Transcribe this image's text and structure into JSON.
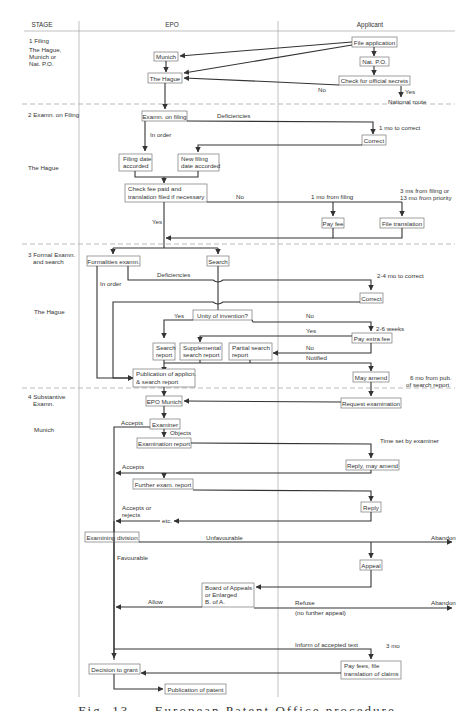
{
  "columns": {
    "stage": "STAGE",
    "epo": "EPO",
    "applicant": "Applicant"
  },
  "stages": [
    {
      "title": "1 Filing",
      "location_lines": [
        "The Hague,",
        "Munich or",
        "Nat. P.O."
      ]
    },
    {
      "title": "2 Examn. on Filing",
      "location_lines": [
        "The Hague"
      ]
    },
    {
      "title_lines": [
        "3 Formal Examn.",
        "and search"
      ],
      "location_lines": [
        "The Hague"
      ]
    },
    {
      "title_lines": [
        "4 Substantive",
        "Examn."
      ],
      "location_lines": [
        "Munich"
      ]
    }
  ],
  "boxes": {
    "file_application": "File application",
    "munich": "Munich",
    "nat_po": "Nat. P.O.",
    "the_hague": "The Hague",
    "check_secrets": "Check for official secrets",
    "examn_on_filing": "Examn. on filing",
    "correct_1": "Correct",
    "filing_date_1": "Filing date",
    "filing_date_2": "accorded",
    "new_filing_1": "New filing",
    "new_filing_2": "date accorded",
    "check_fee_1": "Check fee paid and",
    "check_fee_2": "translation filed if necessary",
    "pay_fee": "Pay fee",
    "file_translation": "File translation",
    "formalities_exam": "Formalities examn.",
    "search": "Search",
    "correct_2": "Correct",
    "unity": "Unity of invention?",
    "pay_extra_fee": "Pay extra fee",
    "search_report_1": "Search",
    "search_report_2": "report",
    "supp_report_1": "Supplemental",
    "supp_report_2": "search report",
    "partial_report_1": "Partial search",
    "partial_report_2": "report",
    "publication_1": "Publication of applicn.",
    "publication_2": "& search report",
    "may_amend": "May amend",
    "epo_munich": "EPO Munich",
    "request_exam": "Request examination",
    "examiner": "Examiner",
    "exam_report": "Examination report",
    "reply_amend": "Reply, may amend",
    "further_exam": "Further exam. report",
    "reply": "Reply",
    "examining_division": "Examining division",
    "appeal": "Appeal",
    "board_1": "Board of Appeals",
    "board_2": "or Enlarged",
    "board_3": "B. of A.",
    "decision": "Decision to grant",
    "pay_fees_1": "Pay fees, file",
    "pay_fees_2": "translation of claims",
    "publication_patent": "Publication of patent"
  },
  "labels": {
    "no_1": "No",
    "yes_1": "Yes",
    "national_route": "National route",
    "deficiencies_1": "Deficiencies",
    "one_mo_correct": "1 mo to correct",
    "in_order_1": "In order",
    "no_2": "No",
    "one_mo_filing": "1 mo from filing",
    "three_ms_1": "3 ms from filing or",
    "three_ms_2": "13 mo from priority",
    "yes_2": "Yes",
    "deficiencies_2": "Deficiencies",
    "two_four_mo": "2-4 mo to correct",
    "in_order_2": "In order",
    "yes_3": "Yes",
    "no_3": "No",
    "two_six_weeks": "2-6 weeks",
    "yes_4": "Yes",
    "no_4": "No",
    "notified": "Notified",
    "six_mo_1": "6 mo from pub.",
    "six_mo_2": "of search report",
    "accepts_1": "Accepts",
    "objects": "Objects",
    "time_set": "Time set by examiner",
    "accepts_2": "Accepts",
    "accepts_rejects_1": "Accepts or",
    "accepts_rejects_2": "rejects",
    "etc": "etc.",
    "unfavourable": "Unfavourable",
    "abandon_1": "Abandon",
    "favourable": "Favourable",
    "allow": "Allow",
    "refuse": "Refuse",
    "no_further_appeal": "(no further appeal)",
    "abandon_2": "Abandon",
    "inform_text": "Inform of accepted text",
    "three_mo": "3 mo"
  },
  "caption": "Fig. 13 — European Patent Office procedure"
}
